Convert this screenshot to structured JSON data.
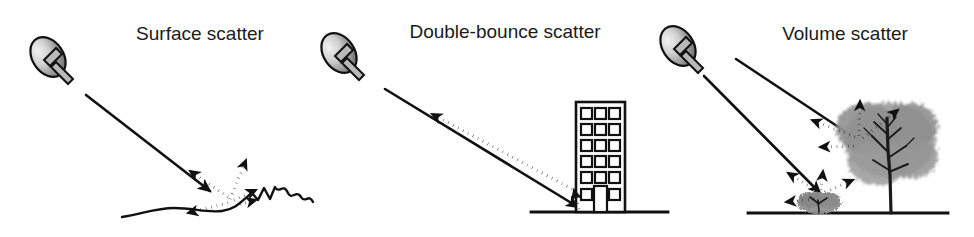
{
  "figure": {
    "background_color": "#ffffff",
    "width": 974,
    "height": 237
  },
  "panels": [
    {
      "id": "surface-scatter",
      "title": "Surface scatter",
      "title_x": 200,
      "title_y": 40,
      "radar_label": "radar antenna",
      "target_label": "rough ground surface",
      "description": "Incident beam strikes a rough surface and scatters diffusely in several directions",
      "incident_beams": 1,
      "scatter_arrow_count": 4,
      "scatter_directions": [
        "up-left",
        "up-right",
        "down-left",
        "right"
      ]
    },
    {
      "id": "double-bounce-scatter",
      "title": "Double-bounce scatter",
      "title_x": 505,
      "title_y": 38,
      "radar_label": "radar antenna",
      "target_label": "building",
      "description": "Incident beam reflects off the ground then off the building wall back toward the radar",
      "incident_beams": 1,
      "scatter_arrow_count": 2,
      "scatter_directions": [
        "wall-up",
        "back-to-radar"
      ],
      "building": {
        "window_columns": 3,
        "window_rows": 6,
        "has_door": true,
        "floors_label": "6"
      }
    },
    {
      "id": "volume-scatter",
      "title": "Volume scatter",
      "title_x": 845,
      "title_y": 40,
      "radar_label": "radar antenna",
      "target_label": "tree canopy and shrub",
      "description": "Incident beams penetrate vegetation and scatter multiple times within the volume",
      "incident_beams": 2,
      "scatter_arrow_count": 7,
      "scatter_directions": [
        "up-left",
        "up",
        "up-right",
        "left",
        "up-left",
        "up",
        "up-right"
      ],
      "vegetation": [
        "tree",
        "shrub"
      ]
    }
  ],
  "legend": {
    "solid_line_meaning": "incident radar beam",
    "dotted_arrow_meaning": "scattered return"
  },
  "colors": {
    "ink": "#111111",
    "dish_light": "#e8e8e8",
    "dish_dark": "#6e6e6e",
    "canopy": "#9a9a9a",
    "background": "#ffffff"
  }
}
